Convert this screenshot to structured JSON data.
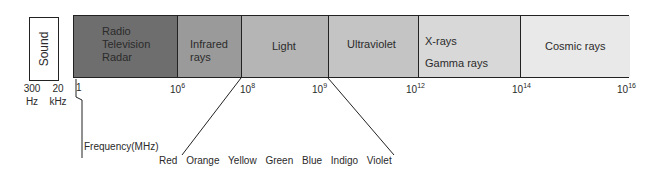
{
  "sound": {
    "label": "Sound",
    "low": {
      "value": "300",
      "unit": "Hz"
    },
    "high": {
      "value": "20",
      "unit": "kHz"
    }
  },
  "spectrum": {
    "segments": [
      {
        "label_lines": [
          "Radio",
          "Television",
          "Radar"
        ],
        "fill": "#6e6e6e"
      },
      {
        "label_lines": [
          "Infrared",
          "rays"
        ],
        "fill": "#9a9a9a"
      },
      {
        "label_lines": [
          "Light"
        ],
        "fill": "#b5b5b5"
      },
      {
        "label_lines": [
          "Ultraviolet"
        ],
        "fill": "#c4c4c4"
      },
      {
        "label_lines": [
          "X-rays",
          "Gamma rays"
        ],
        "fill": "#d8d8d8"
      },
      {
        "label_lines": [
          "Cosmic rays"
        ],
        "fill": "#e9e9e9"
      }
    ],
    "ticks": [
      {
        "base": "1",
        "exp": ""
      },
      {
        "base": "10",
        "exp": "6"
      },
      {
        "base": "10",
        "exp": "8"
      },
      {
        "base": "10",
        "exp": "9"
      },
      {
        "base": "10",
        "exp": "12"
      },
      {
        "base": "10",
        "exp": "14"
      },
      {
        "base": "10",
        "exp": "16"
      }
    ],
    "axis_label": "Frequency(MHz)"
  },
  "visible_colors": [
    "Red",
    "Orange",
    "Yellow",
    "Green",
    "Blue",
    "Indigo",
    "Violet"
  ]
}
